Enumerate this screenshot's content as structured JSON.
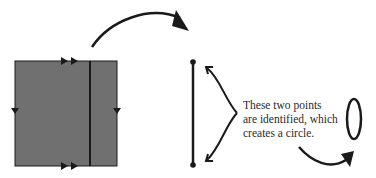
{
  "diagram": {
    "type": "topology-identification",
    "colors": {
      "square_fill": "#707070",
      "stroke": "#1a1a1a",
      "background": "#ffffff",
      "text": "#2a2a2a"
    },
    "square": {
      "label": "square with edge-identification arrows",
      "top_edge_marker": "double-arrow-right",
      "bottom_edge_marker": "double-arrow-right",
      "left_edge_marker": "single-arrow-down",
      "right_edge_marker": "single-arrow-down",
      "interior_line": "vertical line segment"
    },
    "segment": {
      "label": "line segment with two endpoints"
    },
    "result_shape": {
      "label": "circle (ellipse)"
    },
    "caption": {
      "lines": [
        "These two points",
        "are identified, which",
        "creates a circle."
      ]
    }
  }
}
